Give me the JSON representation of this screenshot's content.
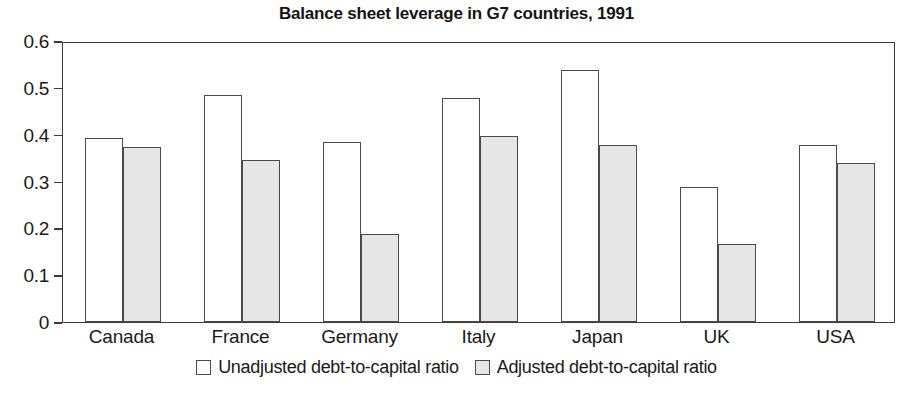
{
  "chart_data": {
    "type": "bar",
    "title": "Balance sheet leverage in G7 countries, 1991",
    "xlabel": "",
    "ylabel": "",
    "ylim": [
      0,
      0.6
    ],
    "ytick_labels": [
      "0.6",
      "0.5",
      "0.4",
      "0.3",
      "0.2",
      "0.1",
      "0"
    ],
    "ytick_values": [
      0.6,
      0.5,
      0.4,
      0.3,
      0.2,
      0.1,
      0
    ],
    "grid": false,
    "legend_position": "bottom-center",
    "categories": [
      "Canada",
      "France",
      "Germany",
      "Italy",
      "Japan",
      "UK",
      "USA"
    ],
    "series": [
      {
        "name": "Unadjusted debt-to-capital ratio",
        "color": "#ffffff",
        "values": [
          0.393,
          0.485,
          0.385,
          0.478,
          0.538,
          0.288,
          0.377
        ]
      },
      {
        "name": "Adjusted debt-to-capital ratio",
        "color": "#e6e6e6",
        "values": [
          0.373,
          0.346,
          0.188,
          0.398,
          0.378,
          0.167,
          0.339
        ]
      }
    ]
  },
  "colors": {
    "bar_outline": "#4a4a4a",
    "axis": "#3c3c3c",
    "unadjusted_fill": "#ffffff",
    "adjusted_fill": "#e6e6e6",
    "text": "#1a1a1a"
  }
}
